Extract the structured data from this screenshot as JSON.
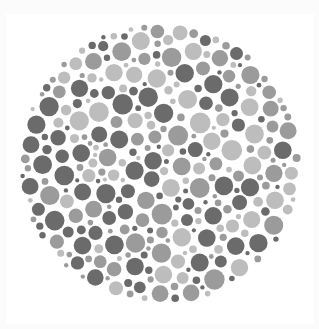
{
  "image": {
    "kind": "color-vision-test-plate",
    "description": "Circular field of gray dots of varying sizes and three tones (dark, medium, light) on a white background",
    "width": 319,
    "height": 329
  },
  "colors": {
    "background": "#ffffff",
    "frame": "#fbfbfb",
    "dot_dark": "#6b6b6b",
    "dot_medium": "#9b9b9b",
    "dot_light": "#bdbdbd"
  },
  "plate": {
    "center_x": 160,
    "center_y": 164,
    "radius": 141,
    "min_dot_radius": 2.2,
    "max_dot_radius": 9.5,
    "gap": 1.6,
    "tone_weights": [
      0.34,
      0.36,
      0.3
    ],
    "seed": 20240
  }
}
